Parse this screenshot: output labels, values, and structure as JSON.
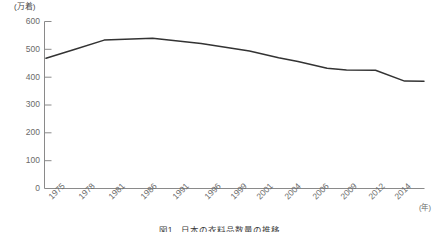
{
  "chart_data": {
    "type": "line",
    "title": "図1　日本の衣料品数量の推移",
    "xlabel": "(年)",
    "ylabel": "(万着)",
    "unit_label": "(万着)",
    "grid": false,
    "legend": "none",
    "xlim_labels": [
      "1975",
      "2014"
    ],
    "ylim": [
      0,
      600
    ],
    "yticks": [
      0,
      100,
      200,
      300,
      400,
      500,
      600
    ],
    "ytick_labels": [
      "0",
      "100",
      "200",
      "300",
      "400",
      "500",
      "600"
    ],
    "categories": [
      "1975",
      "1978",
      "1981",
      "1986",
      "1991",
      "1996",
      "1999",
      "2001",
      "2004",
      "2006",
      "2009",
      "2012",
      "2014"
    ],
    "values": [
      468,
      500,
      533,
      540,
      521,
      494,
      470,
      456,
      432,
      426,
      425,
      386,
      385
    ],
    "series": [
      {
        "name": "数量",
        "color": "#333333",
        "values": [
          468,
          500,
          533,
          540,
          521,
          494,
          470,
          456,
          432,
          426,
          425,
          386,
          385
        ]
      }
    ]
  },
  "axis": {
    "unit_top": "(万着)",
    "unit_right": "(年)"
  },
  "caption": {
    "text": "図1　日本の衣料品数量の推移"
  }
}
